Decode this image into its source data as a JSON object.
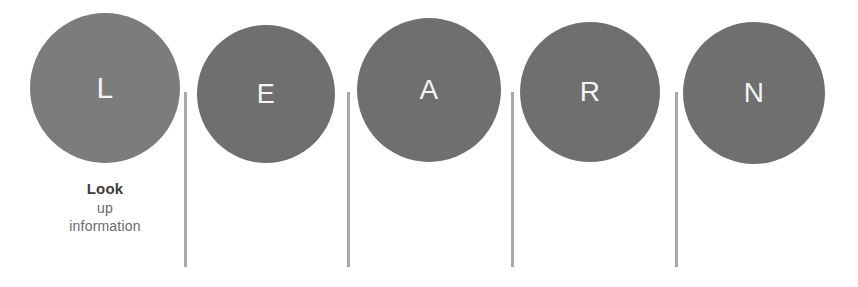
{
  "diagram": {
    "acronym": "LEARN",
    "background_color": "#ffffff",
    "circle_color": "#6f6f6f",
    "circle_color_light": "#7c7c7c",
    "letter_color": "#f4f4f4",
    "divider_color": "#a8a8a8",
    "steps": [
      {
        "letter": "L",
        "caption_bold": "Look",
        "caption_line2": "up",
        "caption_line3": "information",
        "circle_color": "#7c7c7c",
        "x": 30,
        "y": 13,
        "size": 150,
        "letter_size": 30
      },
      {
        "letter": "E",
        "caption_bold": "",
        "caption_line2": "",
        "caption_line3": "",
        "circle_color": "#6f6f6f",
        "x": 197,
        "y": 25,
        "size": 138,
        "letter_size": 27
      },
      {
        "letter": "A",
        "caption_bold": "",
        "caption_line2": "",
        "caption_line3": "",
        "circle_color": "#6f6f6f",
        "x": 357,
        "y": 18,
        "size": 144,
        "letter_size": 28
      },
      {
        "letter": "R",
        "caption_bold": "",
        "caption_line2": "",
        "caption_line3": "",
        "circle_color": "#6f6f6f",
        "x": 520,
        "y": 22,
        "size": 140,
        "letter_size": 28
      },
      {
        "letter": "N",
        "caption_bold": "",
        "caption_line2": "",
        "caption_line3": "",
        "circle_color": "#6f6f6f",
        "x": 683,
        "y": 22,
        "size": 142,
        "letter_size": 28
      }
    ],
    "dividers": [
      {
        "x": 184,
        "y": 92,
        "height": 175
      },
      {
        "x": 347,
        "y": 92,
        "height": 175
      },
      {
        "x": 511,
        "y": 92,
        "height": 175
      },
      {
        "x": 675,
        "y": 92,
        "height": 175
      }
    ]
  }
}
